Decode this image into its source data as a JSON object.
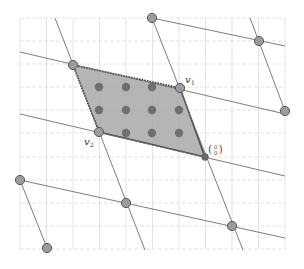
{
  "figure": {
    "labels": {
      "v1": "v",
      "v1_sub": "1",
      "v2": "v",
      "v2_sub": "2",
      "origin_top": "0",
      "origin_bottom": "0"
    },
    "colors": {
      "background": "#ffffff",
      "grid": "#d9d9d9",
      "lattice_line": "#6e6e6e",
      "parallelogram_fill": "#a9a9a9",
      "parallelogram_edge": "#4a4a4a",
      "lattice_point": "#9a9a9a",
      "lattice_point_stroke": "#555555",
      "interior_point": "#6f6f6f"
    },
    "grid": {
      "x_lines": [
        20,
        46.5,
        73,
        99.5,
        126,
        152.5,
        179,
        205.5,
        232,
        258.5,
        285
      ],
      "y_lines": [
        18,
        41,
        64,
        87,
        110,
        133,
        157,
        180,
        203,
        226,
        249
      ],
      "x_min": 20,
      "x_max": 285,
      "y_min": 18,
      "y_max": 249
    },
    "lattice_points": [
      {
        "x": 152,
        "y": 18
      },
      {
        "x": 259,
        "y": 41
      },
      {
        "x": 73,
        "y": 65
      },
      {
        "x": 180,
        "y": 88
      },
      {
        "x": 285,
        "y": 111
      },
      {
        "x": 99,
        "y": 132
      },
      {
        "x": 205,
        "y": 157
      },
      {
        "x": 20,
        "y": 180
      },
      {
        "x": 126,
        "y": 203
      },
      {
        "x": 232,
        "y": 226
      },
      {
        "x": 47,
        "y": 248
      }
    ],
    "interior_points": [
      {
        "x": 99,
        "y": 87
      },
      {
        "x": 126,
        "y": 87
      },
      {
        "x": 152,
        "y": 87
      },
      {
        "x": 99,
        "y": 110
      },
      {
        "x": 126,
        "y": 110
      },
      {
        "x": 152,
        "y": 110
      },
      {
        "x": 179,
        "y": 110
      },
      {
        "x": 126,
        "y": 133
      },
      {
        "x": 152,
        "y": 133
      },
      {
        "x": 179,
        "y": 133
      }
    ],
    "parallelogram": {
      "origin": {
        "x": 205,
        "y": 157
      },
      "v1": {
        "x": 180,
        "y": 88
      },
      "v1_plus_v2": {
        "x": 73,
        "y": 65
      },
      "v2": {
        "x": 99,
        "y": 132
      }
    }
  }
}
